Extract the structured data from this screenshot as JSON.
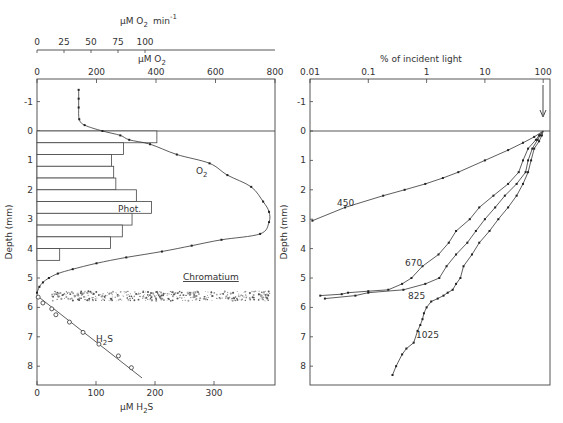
{
  "chart_data": [
    {
      "type": "line",
      "title": "",
      "panel": "left",
      "top_axes": [
        {
          "label": "µM O2 min-1",
          "ticks": [
            "0",
            "25",
            "50",
            "75",
            "100"
          ],
          "range": [
            0,
            100
          ]
        },
        {
          "label": "µM O2",
          "ticks": [
            "0",
            "200",
            "400",
            "600",
            "800"
          ],
          "range": [
            0,
            800
          ]
        }
      ],
      "bottom_axis": {
        "label": "µM H2S",
        "ticks": [
          "0",
          "100",
          "200",
          "300"
        ],
        "range": [
          0,
          400
        ]
      },
      "ylabel": "Depth (mm)",
      "yticks": [
        "-1",
        "0",
        "1",
        "2",
        "3",
        "4",
        "5",
        "6",
        "7",
        "8"
      ],
      "ylim": [
        -1.7,
        8.5
      ],
      "series": [
        {
          "name": "O2",
          "unit": "µM O2",
          "depth": [
            -1.4,
            -1.1,
            -0.8,
            -0.4,
            -0.2,
            0.0,
            0.15,
            0.3,
            0.45,
            0.8,
            1.1,
            1.5,
            1.9,
            2.4,
            2.75,
            3.1,
            3.5,
            3.7,
            3.9,
            4.1,
            4.3,
            4.5,
            4.7,
            4.85,
            5.0,
            5.15,
            5.3,
            5.5
          ],
          "values": [
            140,
            140,
            140,
            142,
            160,
            220,
            280,
            310,
            380,
            470,
            580,
            640,
            720,
            760,
            780,
            780,
            750,
            620,
            520,
            420,
            300,
            200,
            120,
            70,
            40,
            20,
            8,
            0
          ]
        },
        {
          "name": "H2S",
          "unit": "µM H2S",
          "depth": [
            5.5,
            5.65,
            5.85,
            6.05,
            6.25,
            6.5,
            6.85,
            7.25,
            7.65,
            8.05,
            8.4
          ],
          "values": [
            0,
            2,
            10,
            25,
            32,
            55,
            78,
            105,
            138,
            160,
            178
          ]
        },
        {
          "name": "Phot.",
          "type": "bar",
          "unit": "µM O2 min-1",
          "depth_bins": [
            "0.0-0.4",
            "0.4-0.8",
            "0.8-1.2",
            "1.2-1.6",
            "1.6-2.0",
            "2.0-2.4",
            "2.4-2.8",
            "2.8-3.2",
            "3.2-3.6",
            "3.6-4.0",
            "4.0-4.4"
          ],
          "values": [
            111,
            80,
            69,
            71,
            73,
            92,
            106,
            88,
            79,
            68,
            21
          ]
        }
      ],
      "annotations": [
        "O2",
        "Phot.",
        "H2S",
        "Chromatium"
      ],
      "chromatium_layer_depth": [
        5.45,
        5.75
      ]
    },
    {
      "type": "line",
      "panel": "right",
      "xlabel": "% of incident light",
      "xscale": "log",
      "xticks": [
        "0.01",
        "0.1",
        "1",
        "10",
        "100"
      ],
      "xlim": [
        0.01,
        100
      ],
      "ylabel": "Depth (mm)",
      "yticks": [
        "-1",
        "0",
        "1",
        "2",
        "3",
        "4",
        "5",
        "6",
        "7",
        "8"
      ],
      "ylim": [
        -1.7,
        8.5
      ],
      "arrow_at": 100,
      "series": [
        {
          "name": "450",
          "depth": [
            0,
            0.2,
            0.4,
            0.65,
            1.0,
            1.4,
            1.6,
            1.8,
            2.0,
            2.2,
            2.6,
            3.05
          ],
          "values": [
            100,
            70,
            45,
            25,
            10,
            3.5,
            1.9,
            0.95,
            0.42,
            0.18,
            0.04,
            0.011
          ]
        },
        {
          "name": "670",
          "depth": [
            0,
            0.15,
            0.3,
            0.6,
            1.0,
            1.4,
            1.8,
            2.2,
            2.6,
            3.0,
            3.4,
            3.8,
            4.2,
            4.6,
            5.0,
            5.2,
            5.4,
            5.45,
            5.5,
            5.55,
            5.6
          ],
          "values": [
            100,
            85,
            75,
            55,
            45,
            38,
            25,
            14,
            8,
            5.5,
            3.2,
            2.4,
            1.6,
            0.85,
            0.55,
            0.38,
            0.22,
            0.1,
            0.045,
            0.035,
            0.015
          ]
        },
        {
          "name": "825",
          "depth": [
            0,
            0.15,
            0.3,
            0.6,
            1.0,
            1.4,
            1.8,
            2.2,
            2.6,
            3.0,
            3.4,
            3.8,
            4.2,
            4.6,
            5.0,
            5.2,
            5.4,
            5.5,
            5.6,
            5.7
          ],
          "values": [
            100,
            88,
            80,
            65,
            55,
            50,
            35,
            22,
            15,
            10,
            7,
            5,
            3.2,
            2.2,
            1.65,
            0.95,
            0.4,
            0.1,
            0.06,
            0.018
          ]
        },
        {
          "name": "1025",
          "depth": [
            0,
            0.15,
            0.35,
            0.6,
            1.0,
            1.4,
            1.8,
            2.2,
            2.6,
            3.0,
            3.4,
            3.8,
            4.2,
            4.6,
            5.0,
            5.2,
            5.4,
            5.5,
            5.6,
            5.7,
            5.8,
            6.0,
            6.2,
            6.4,
            6.6,
            6.8,
            7.2,
            7.4,
            7.6,
            8.0,
            8.3
          ],
          "values": [
            100,
            95,
            85,
            70,
            62,
            55,
            45,
            35,
            25,
            17,
            12,
            8,
            6,
            4.3,
            3.8,
            3.2,
            2.8,
            2.3,
            1.95,
            1.55,
            1.2,
            1.0,
            0.9,
            0.85,
            0.78,
            0.7,
            0.6,
            0.45,
            0.38,
            0.3,
            0.26
          ]
        }
      ],
      "annotations": [
        "450",
        "670",
        "825",
        "1025"
      ]
    }
  ],
  "left": {
    "rate_axis_label": "µM O",
    "rate_axis_sub": "2",
    "rate_axis_unit": "min",
    "rate_axis_sup": "-1",
    "rate_ticks": [
      "0",
      "25",
      "50",
      "75",
      "100"
    ],
    "o2_axis_label": "µM O",
    "o2_axis_sub": "2",
    "o2_ticks": [
      "0",
      "200",
      "400",
      "600",
      "800"
    ],
    "h2s_axis_label": "µM H",
    "h2s_axis_sub": "2",
    "h2s_axis_tail": "S",
    "h2s_ticks": [
      "0",
      "100",
      "200",
      "300"
    ],
    "ylabel": "Depth (mm)",
    "yticks": [
      "-1",
      "0",
      "1",
      "2",
      "3",
      "4",
      "5",
      "6",
      "7",
      "8"
    ],
    "label_o2": "O",
    "label_o2_sub": "2",
    "label_phot": "Phot.",
    "label_h2s": "H",
    "label_h2s_sub": "2",
    "label_h2s_tail": "S",
    "label_chromatium": "Chromatium"
  },
  "right": {
    "xlabel": "% of incident light",
    "xticks": [
      "0.01",
      "0.1",
      "1",
      "10",
      "100"
    ],
    "ylabel": "Depth (mm)",
    "yticks": [
      "-1",
      "0",
      "1",
      "2",
      "3",
      "4",
      "5",
      "6",
      "7",
      "8"
    ],
    "labels": [
      "450",
      "670",
      "825",
      "1025"
    ]
  }
}
